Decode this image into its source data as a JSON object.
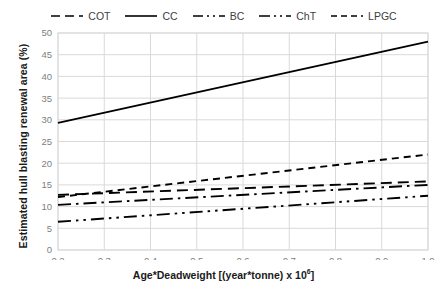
{
  "chart_data": {
    "type": "line",
    "title": "",
    "xlabel": "Age*Deadweight [(year*tonne) x 10^6]",
    "xlabel_main": "Age*Deadweight [(year*tonne) x 10",
    "xlabel_sup": "6",
    "xlabel_tail": "]",
    "ylabel": "Estimated hull blasting renewal area (%)",
    "xlim": [
      0.2,
      1.0
    ],
    "ylim": [
      0,
      50
    ],
    "xticks": [
      "0.2",
      "0.3",
      "0.4",
      "0.5",
      "0.6",
      "0.7",
      "0.8",
      "0.9",
      "1.0"
    ],
    "yticks": [
      "0",
      "5",
      "10",
      "15",
      "20",
      "25",
      "30",
      "35",
      "40",
      "45",
      "50"
    ],
    "grid": true,
    "legend_position": "top-center",
    "x": [
      0.2,
      1.0
    ],
    "series": [
      {
        "name": "COT",
        "dash": "dashed",
        "color": "#000000",
        "values": [
          12.7,
          15.8
        ]
      },
      {
        "name": "CC",
        "dash": "solid",
        "color": "#000000",
        "values": [
          29.3,
          48.0
        ]
      },
      {
        "name": "BC",
        "dash": "dash-dot",
        "color": "#000000",
        "values": [
          10.4,
          15.0
        ]
      },
      {
        "name": "ChT",
        "dash": "dash-dot-dot",
        "color": "#000000",
        "values": [
          6.5,
          12.5
        ]
      },
      {
        "name": "LPGC",
        "dash": "fine-dashed",
        "color": "#000000",
        "values": [
          12.2,
          22.0
        ]
      }
    ]
  },
  "legend": {
    "items": [
      {
        "label": "COT",
        "swatch": "dashed-line-swatch"
      },
      {
        "label": "CC",
        "swatch": "solid-line-swatch"
      },
      {
        "label": "BC",
        "swatch": "dash-dot-line-swatch"
      },
      {
        "label": "ChT",
        "swatch": "dash-dot-dot-line-swatch"
      },
      {
        "label": "LPGC",
        "swatch": "fine-dashed-line-swatch"
      }
    ]
  },
  "axes": {
    "y_title": "Estimated hull blasting renewal area (%)",
    "x_title_main": "Age*Deadweight [(year*tonne) x 10",
    "x_title_sup": "6",
    "x_title_tail": "]"
  },
  "colors": {
    "line": "#000000",
    "grid": "#d9d9d9",
    "tick_text": "#808080",
    "axis_title": "#1a1a1a",
    "legend_text": "#404040",
    "background": "#ffffff"
  }
}
